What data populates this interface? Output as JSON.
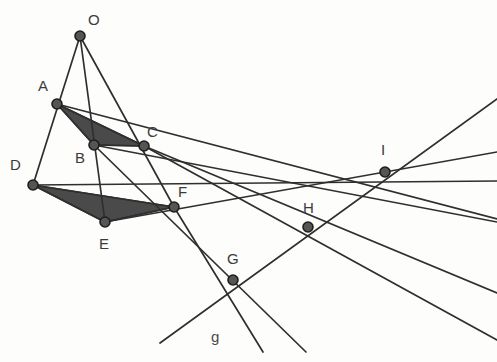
{
  "figure": {
    "width": 497,
    "height": 362,
    "background_color": "#fdfdfc",
    "stroke_color": "#2f2f2f",
    "fill_color": "#4a4a4a",
    "point_fill_color": "#555555",
    "point_stroke_color": "#1e1e1e",
    "label_color": "#3b3b3b",
    "line_width": 1.7,
    "point_radius": 5
  },
  "points": [
    {
      "id": "O",
      "label": "O",
      "x": 80,
      "y": 36,
      "label_x": 88,
      "label_y": 12
    },
    {
      "id": "A",
      "label": "A",
      "x": 57,
      "y": 104,
      "label_x": 38,
      "label_y": 78
    },
    {
      "id": "B",
      "label": "B",
      "x": 94,
      "y": 145,
      "label_x": 75,
      "label_y": 150
    },
    {
      "id": "C",
      "label": "C",
      "x": 144,
      "y": 146,
      "label_x": 147,
      "label_y": 124
    },
    {
      "id": "D",
      "label": "D",
      "x": 33,
      "y": 185,
      "label_x": 10,
      "label_y": 157
    },
    {
      "id": "E",
      "label": "E",
      "x": 105,
      "y": 222,
      "label_x": 99,
      "label_y": 236
    },
    {
      "id": "F",
      "label": "F",
      "x": 174,
      "y": 207,
      "label_x": 178,
      "label_y": 184
    },
    {
      "id": "G",
      "label": "G",
      "x": 233,
      "y": 280,
      "label_x": 227,
      "label_y": 251
    },
    {
      "id": "H",
      "label": "H",
      "x": 308,
      "y": 227,
      "label_x": 303,
      "label_y": 200
    },
    {
      "id": "I",
      "label": "I",
      "x": 385,
      "y": 172,
      "label_x": 381,
      "label_y": 142
    }
  ],
  "line_labels": [
    {
      "id": "g",
      "label": "g",
      "x": 211,
      "y": 329
    }
  ],
  "segments": [
    {
      "name": "O-A-D",
      "x1": 80,
      "y1": 36,
      "x2": 33,
      "y2": 185
    },
    {
      "name": "O-B-E",
      "x1": 80,
      "y1": 36,
      "x2": 105,
      "y2": 222
    },
    {
      "name": "O-C-F",
      "x1": 80,
      "y1": 36,
      "x2": 174,
      "y2": 207
    },
    {
      "name": "triangle-AB",
      "x1": 57,
      "y1": 104,
      "x2": 94,
      "y2": 145
    },
    {
      "name": "triangle-BC",
      "x1": 94,
      "y1": 145,
      "x2": 144,
      "y2": 146
    },
    {
      "name": "triangle-AC",
      "x1": 57,
      "y1": 104,
      "x2": 144,
      "y2": 146
    },
    {
      "name": "triangle-DE",
      "x1": 33,
      "y1": 185,
      "x2": 105,
      "y2": 222
    },
    {
      "name": "triangle-EF",
      "x1": 105,
      "y1": 222,
      "x2": 174,
      "y2": 207
    },
    {
      "name": "triangle-DF",
      "x1": 33,
      "y1": 185,
      "x2": 174,
      "y2": 207
    },
    {
      "name": "axis-line-AB-DE-through-G",
      "x1": 144,
      "y1": 146,
      "x2": 497,
      "y2": 340
    },
    {
      "name": "line-AC-DF-to-I",
      "x1": 57,
      "y1": 104,
      "x2": 497,
      "y2": 219
    },
    {
      "name": "line-BC-EF-to-I",
      "x1": 94,
      "y1": 145,
      "x2": 497,
      "y2": 222
    },
    {
      "name": "line-through-G-H-I",
      "x1": 160,
      "y1": 343,
      "x2": 497,
      "y2": 99
    },
    {
      "name": "line-C-through-H",
      "x1": 144,
      "y1": 146,
      "x2": 497,
      "y2": 293
    },
    {
      "name": "line-D-through-F-H-I",
      "x1": 33,
      "y1": 185,
      "x2": 497,
      "y2": 181
    },
    {
      "name": "line-E-through-F-I",
      "x1": 105,
      "y1": 222,
      "x2": 497,
      "y2": 152
    },
    {
      "name": "line-B-through-G",
      "x1": 94,
      "y1": 145,
      "x2": 306,
      "y2": 352
    },
    {
      "name": "line-F-through-G",
      "x1": 174,
      "y1": 207,
      "x2": 263,
      "y2": 352
    }
  ],
  "shaded_triangles": [
    {
      "name": "triangle-ABC",
      "vertices": "57,104 94,145 144,146"
    },
    {
      "name": "triangle-DEF",
      "vertices": "33,185 105,222 174,207"
    }
  ]
}
